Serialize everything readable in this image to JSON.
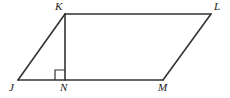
{
  "figure": {
    "name": "parallelogram-jklm-with-altitude",
    "background_color": "#ffffff",
    "stroke_color": "#333333",
    "label_color": "#1a1a1a",
    "width": 230,
    "height": 98,
    "vertices": [
      {
        "id": "J",
        "label": "J",
        "x": 18,
        "y": 80,
        "label_x": 9,
        "label_y": 82
      },
      {
        "id": "K",
        "label": "K",
        "x": 65,
        "y": 14,
        "label_x": 55,
        "label_y": 1
      },
      {
        "id": "L",
        "label": "L",
        "x": 211,
        "y": 14,
        "label_x": 214,
        "label_y": 1
      },
      {
        "id": "M",
        "label": "M",
        "x": 163,
        "y": 80,
        "label_x": 158,
        "label_y": 82
      },
      {
        "id": "N",
        "label": "N",
        "x": 65,
        "y": 80,
        "label_x": 60,
        "label_y": 82
      }
    ],
    "segments": [
      {
        "id": "JK",
        "from": "J",
        "to": "K",
        "x1": 18,
        "y1": 80,
        "x2": 65,
        "y2": 14
      },
      {
        "id": "KL",
        "from": "K",
        "to": "L",
        "x1": 65,
        "y1": 14,
        "x2": 211,
        "y2": 14
      },
      {
        "id": "LM",
        "from": "L",
        "to": "M",
        "x1": 211,
        "y1": 14,
        "x2": 163,
        "y2": 80
      },
      {
        "id": "MJ",
        "from": "M",
        "to": "J",
        "x1": 163,
        "y1": 80,
        "x2": 18,
        "y2": 80
      },
      {
        "id": "KN",
        "from": "K",
        "to": "N",
        "x1": 65,
        "y1": 14,
        "x2": 65,
        "y2": 80
      }
    ],
    "right_angle_marker": {
      "at_vertex": "N",
      "side": "left",
      "size": 10,
      "points": "55,80 55,70 65,70"
    }
  }
}
